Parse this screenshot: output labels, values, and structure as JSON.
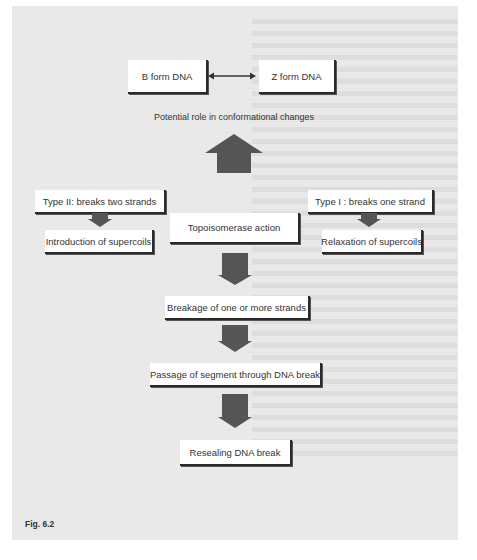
{
  "figure": {
    "label": "Fig. 6.2",
    "top_row": {
      "left_box": "B form DNA",
      "right_box": "Z form DNA",
      "connector": "double-headed-arrow"
    },
    "conformational_caption": "Potential role in conformational changes",
    "center_box": "Topoisomerase action",
    "left_branch": {
      "type_box": "Type II: breaks two strands",
      "result_box": "Introduction of supercoils"
    },
    "right_branch": {
      "type_box": "Type I : breaks one strand",
      "result_box": "Relaxation of supercoils"
    },
    "steps": [
      "Breakage of one or more strands",
      "Passage of segment through DNA break",
      "Resealing DNA break"
    ]
  },
  "colors": {
    "background_panel": "#e9e9e9",
    "box_fill": "#ffffff",
    "arrow_fill": "#555555",
    "text": "#333333"
  }
}
